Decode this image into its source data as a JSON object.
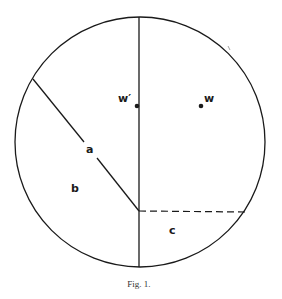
{
  "figure": {
    "caption": "Fig. 1.",
    "labels": {
      "a": "a",
      "b": "b",
      "c": "c",
      "w": "w",
      "w_prime": "w′"
    },
    "colors": {
      "stroke": "#1a1a1a",
      "background": "#ffffff"
    }
  }
}
